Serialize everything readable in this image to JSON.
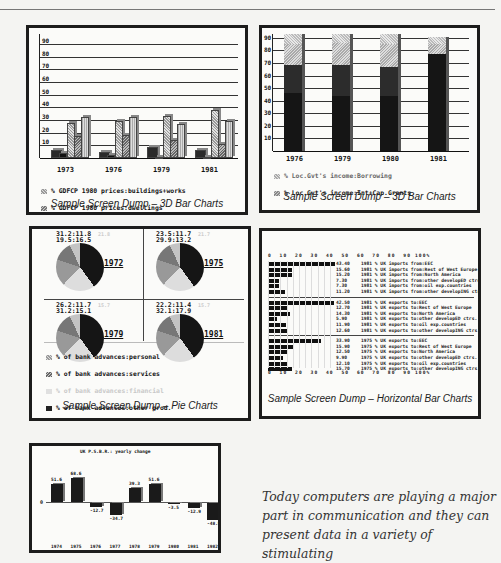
{
  "page": {
    "paragraph": "Today computers are playing a major part in communication and they can present data in a variety of stimulating"
  },
  "panels": {
    "bar3d_left": {
      "caption": "Sample Screen Dump – 3D Bar Charts",
      "legend": [
        "GDFCP 1980 prices:buildings+works",
        "GDFCP 1980 prices:dwellings",
        "GDFCP 1980 prices:plant+mach.",
        "GDFCP 1980 prices:R.stock/sh/acraft",
        "GDFCP 1980 prices:vehicles"
      ]
    },
    "bar3d_right": {
      "caption": "Sample Screen Dump – 3D Bar Charts",
      "legend": [
        "Loc.Gvt's income:Borrowing",
        "Loc.Gvt's income:Int+Cap.Grants",
        "Loc.Gvt's income:Rates",
        "Loc.Gvt's income:RSG+specific gts"
      ]
    },
    "pie": {
      "caption": "Sample Screen Dump – Pie Charts",
      "legend": [
        "of bank advances:personal",
        "of bank advances:services",
        "of bank advances:financial",
        "of bank advances:other prod.",
        "of bank advances:manufacturing"
      ]
    },
    "hbar": {
      "caption": "Sample Screen Dump – Horizontal Bar Charts",
      "axis": "0  10  20  30  40  50  60  70  80  90 100%"
    },
    "yearly": {
      "title": "UK P.S.B.R.: yearly change",
      "zero_label": "0"
    }
  },
  "chart_data": [
    {
      "type": "bar",
      "title": "GDFCP 1980 prices (3D bar)",
      "categories": [
        "1973",
        "1976",
        "1979",
        "1981"
      ],
      "ylim": [
        0,
        90
      ],
      "yticks": [
        10,
        20,
        30,
        40,
        50,
        60,
        70,
        80,
        90
      ],
      "series": [
        {
          "name": "GDFCP 1980 prices:buildings+works",
          "values": [
            28,
            29,
            33,
            38
          ]
        },
        {
          "name": "GDFCP 1980 prices:dwellings",
          "values": [
            17,
            18,
            14,
            11
          ]
        },
        {
          "name": "GDFCP 1980 prices:plant+mach.",
          "values": [
            32,
            32,
            27,
            29
          ]
        },
        {
          "name": "GDFCP 1980 prices:R.stock/sh/acraft",
          "values": [
            6,
            5,
            9,
            6
          ]
        },
        {
          "name": "GDFCP 1980 prices:vehicles",
          "values": [
            4,
            2,
            1,
            1
          ]
        }
      ]
    },
    {
      "type": "bar",
      "title": "Loc.Gvt's income (stacked 3D bar)",
      "categories": [
        "1976",
        "1979",
        "1980",
        "1981"
      ],
      "ylim": [
        0,
        90
      ],
      "yticks": [
        10,
        20,
        30,
        40,
        50,
        60,
        70,
        80,
        90
      ],
      "series": [
        {
          "name": "Loc.Gvt's income:RSG+specific gts",
          "values": [
            46,
            44,
            44,
            77
          ]
        },
        {
          "name": "Loc.Gvt's income:Rates",
          "values": [
            22,
            24,
            23,
            0
          ]
        },
        {
          "name": "Loc.Gvt's income:Int+Cap.Grants",
          "values": [
            17,
            18,
            18,
            8
          ]
        },
        {
          "name": "Loc.Gvt's income:Borrowing",
          "values": [
            8,
            7,
            8,
            6
          ]
        }
      ]
    },
    {
      "type": "pie",
      "title": "of bank advances",
      "categories": [
        "1972",
        "1975",
        "1979",
        "1981"
      ],
      "slices": [
        {
          "year": "1972",
          "labels": [
            "31.2",
            "11.8",
            "21.8",
            "19.5",
            "16.5"
          ]
        },
        {
          "year": "1975",
          "labels": [
            "23.5",
            "11.7",
            "21.7",
            "29.9",
            "13.2"
          ]
        },
        {
          "year": "1979",
          "labels": [
            "26.2",
            "11.7",
            "15.7",
            "31.2",
            "15.1"
          ]
        },
        {
          "year": "1981",
          "labels": [
            "22.2",
            "11.4",
            "15.7",
            "32.1",
            "17.9"
          ]
        }
      ]
    },
    {
      "type": "bar",
      "orientation": "horizontal",
      "title": "UK imports / exports by region",
      "xlim": [
        0,
        100
      ],
      "xticks": [
        0,
        10,
        20,
        30,
        40,
        50,
        60,
        70,
        80,
        90,
        100
      ],
      "groups": [
        {
          "name": "1981 % UK imports",
          "rows": [
            {
              "value": 43.4,
              "label": "1981 % UK imports from:EEC"
            },
            {
              "value": 15.6,
              "label": "1981 % UK imports from:Rest of West Europe"
            },
            {
              "value": 15.2,
              "label": "1981 % UK imports from:North America"
            },
            {
              "value": 7.3,
              "label": "1981 % UK imports from:other developED ctrs."
            },
            {
              "value": 7.3,
              "label": "1981 % UK imports from:oil exp.countries"
            },
            {
              "value": 11.2,
              "label": "1981 % UK imports from:other developING ctrs"
            }
          ]
        },
        {
          "name": "1981 % UK exports",
          "rows": [
            {
              "value": 42.5,
              "label": "1981 % UK exports to:EEC"
            },
            {
              "value": 12.7,
              "label": "1981 % UK exports to:Rest of West Europe"
            },
            {
              "value": 14.3,
              "label": "1981 % UK exports to:North America"
            },
            {
              "value": 5.9,
              "label": "1981 % UK exports to:other developED ctrs."
            },
            {
              "value": 11.9,
              "label": "1981 % UK exports to:oil exp.countries"
            },
            {
              "value": 12.6,
              "label": "1981 % UK exports to:other developING ctrs."
            }
          ]
        },
        {
          "name": "1975 % UK exports",
          "rows": [
            {
              "value": 33.9,
              "label": "1975 % UK exports to:EEC"
            },
            {
              "value": 15.9,
              "label": "1975 % UK exports to:Rest of West Europe"
            },
            {
              "value": 12.5,
              "label": "1975 % UK exports to:North America"
            },
            {
              "value": 9.9,
              "label": "1975 % UK exports to:other developED ctrs."
            },
            {
              "value": 12.1,
              "label": "1975 % UK exports to:oil exp.countries"
            },
            {
              "value": 15.7,
              "label": "1975 % UK exports to:other developING ctrs."
            }
          ]
        }
      ]
    },
    {
      "type": "bar",
      "title": "UK P.S.B.R.: yearly change",
      "categories": [
        "1974",
        "1975",
        "1976",
        "1977",
        "1978",
        "1979",
        "1980",
        "1981",
        "1982"
      ],
      "values": [
        51.6,
        68.6,
        -12.7,
        -34.7,
        39.3,
        51.6,
        -3.5,
        -12.9,
        -48.9
      ],
      "xlabel": "",
      "ylabel": ""
    }
  ]
}
